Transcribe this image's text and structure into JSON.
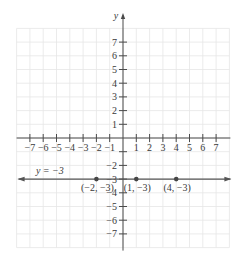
{
  "chart_data": {
    "type": "line",
    "title": "",
    "xlabel": "",
    "ylabel": "y",
    "xlim": [
      -8,
      8
    ],
    "ylim": [
      -8,
      8
    ],
    "grid": true,
    "x_ticks": [
      -7,
      -6,
      -5,
      -4,
      -3,
      -2,
      -1,
      1,
      2,
      3,
      4,
      5,
      6,
      7
    ],
    "x_tick_labels": [
      "−7",
      "−6",
      "−5",
      "−4",
      "−3",
      "−2",
      "−1",
      "1",
      "2",
      "3",
      "4",
      "5",
      "6",
      "7"
    ],
    "y_ticks": [
      7,
      6,
      5,
      4,
      3,
      2,
      1,
      -1,
      -2,
      -3,
      -4,
      -5,
      -6,
      -7
    ],
    "y_tick_labels": [
      "7",
      "6",
      "5",
      "4",
      "3",
      "2",
      "1",
      "",
      "−2",
      "−3",
      "−4",
      "−5",
      "−6",
      "−7"
    ],
    "series": [
      {
        "name": "y = −3",
        "equation": "y = −3",
        "kind": "horizontal-line",
        "y": -3,
        "x_range": [
          -8,
          8
        ],
        "arrows": "both",
        "color": "#555555"
      }
    ],
    "points": [
      {
        "x": -2,
        "y": -3,
        "label": "(−2, −3)"
      },
      {
        "x": 1,
        "y": -3,
        "label": "(1, −3)"
      },
      {
        "x": 4,
        "y": -3,
        "label": "(4, −3)"
      }
    ],
    "annotations": [
      {
        "text": "y = −3",
        "x": -5.5,
        "y": -2.6
      }
    ],
    "colors": {
      "grid": "#e6e6e6",
      "axis": "#4a4a4a",
      "line": "#555555",
      "point": "#454545",
      "text": "#3a3a3a"
    }
  }
}
